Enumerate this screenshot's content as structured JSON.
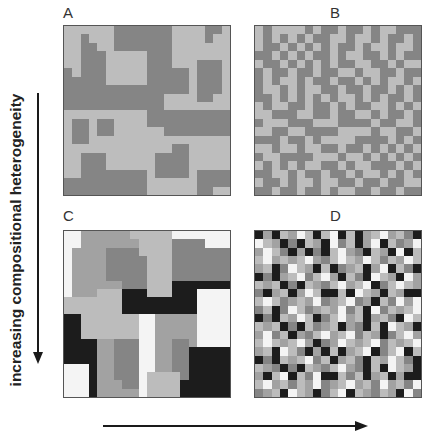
{
  "labels": {
    "A": "A",
    "B": "B",
    "C": "C",
    "D": "D",
    "y_axis": "increasing compositional heterogeneity",
    "x_axis": ""
  },
  "palette": {
    "W": "#f4f4f4",
    "L": "#bcbcbc",
    "M": "#a2a2a2",
    "D": "#858585",
    "K": "#1c1c1c",
    "A_light": "#bdbdbd",
    "A_dark": "#858585"
  },
  "panels": {
    "A": {
      "description": "two-class coarse-grained landscape",
      "rows": [
        "LLLLLLDDDDDDDLLLLDDL",
        "LLDLLLDDDDDDDLLLLDLL",
        "LLDDLLDDDDDDDLLLLLLL",
        "LLDDDLLLLLDDDLLLLLLL",
        "LLDDDLLLLLDDDLLLDDDL",
        "DLDDDLLLLLDDDDDLDDDL",
        "DDDDDLLLLLDDDDDLDDDL",
        "DDDDDDDDDDDDDDDLDDDL",
        "DDDDDDDDDDDDLLLLDDLL",
        "DDDDDDDDDDDDLLLLLLLL",
        "LLLLLLLLLLDDDDDDDDDD",
        "LDDLDDLLLLDDDDDDDDDD",
        "LDDLDDLLLLLLDDDDDDDD",
        "LDDLLLLLLLLLLLLLLLLL",
        "LLLLLLLLLLLLLDDLLLLL",
        "LLDDDLLLLLLDDDDLLLLL",
        "LLDDDLLLLLLDDDDLLLLL",
        "LLDDDDDDDDLDDDDLDDDD",
        "DDDDDDDDDDLLLLLLDDDD",
        "DDDDDDDDDDLLLLLLDDLL"
      ]
    },
    "B": {
      "description": "two-class fine-grained landscape",
      "rows": [
        "LDLLLLDLDDLDDLDLLDDD",
        "LDLDLDLDDLLDLLDLDDLD",
        "LDDLDLDLDLDDLDLLDLLD",
        "DDLDLDLDDLDLLDDLDLDD",
        "LDDLDLDLDLDDLLDDLDLL",
        "DLDDLDDLDDLLDLLDDLDD",
        "DLDLLDLDDLDDLDLDLLDL",
        "DLLDLDLLDDLDDLDDLDLD",
        "DDLDLDLDLDLLDLDLDDLD",
        "LDLLDDLDDLDLDDLLDLDL",
        "LLDDDLLDDLDDLLDLDDLD",
        "DLLLDDDLLLDDDDLDDLLD",
        "LLDDLLDDDDLLLLDLLDDL",
        "DDDLDDLDLLLLDDDDLDLD",
        "LLDLLDLLDDLDDLDLDLDL",
        "DLLDDDDLLLDLLDLDLDLD",
        "LDLDLDLLDDLDLLDDDLDL",
        "DDLLDLDDLDDLDLLDLDLD",
        "LDDLDLLDLLDDLDDLDDLL",
        "DDLDDLDDLDLLDDLDDLDD"
      ]
    },
    "C": {
      "description": "five-class coarse-grained landscape",
      "rows": [
        "WWMMMMMMLLLLLWWWWWWW",
        "WWMMMMMMMLLLLDDDDWWW",
        "WMMMMDDDDLLLLDDDDDDD",
        "WMMMMDDDDDLLLDDDDDDD",
        "WMMMMDDDDDLLLDDDDDDD",
        "WMMMMDDDDDLLLDDDDDDD",
        "WMMMMMMDDDLLLKKKKKKK",
        "WMMMLLLKKKLLLKKKWWWW",
        "LLLLLLLKKKKKKKKKWWWW",
        "LLLLLLLKKKKKKKKKWWWW",
        "KKLLLLLLLWWMMMMMWWWW",
        "KKLLLLLLLWWMMMMMWWWW",
        "KKLLLLLLLWWMMMMMWWWW",
        "KKKKMMDDDWWMMDDMWWWW",
        "KKKKMMDDDWWMMDDKKKKK",
        "KKKKMMDDDWWMMDDKKKKK",
        "WWWKMMDDDWWMMDDKKKKK",
        "WWWKMMDDDWLLLLDKKKKK",
        "WWWKMMMDDWLLLLKKKKKK",
        "WWWKMMMMMWLLLLKKKKKK"
      ]
    },
    "D": {
      "description": "five-class fine-grained landscape",
      "rows": [
        "KMKLMWLKLWKLKMLWMLDK",
        "WLMKDKLMKWDLKMWKLDMW",
        "MWLDKMKDKLWMDKLMKWKL",
        "LWMLMLWMDLWLMWLDLMWL",
        "MLKDWLMKLKDMLKMWKLDK",
        "KDKMLWDLWMKLDKWLMKWM",
        "LMLKDKLMDLWMLWKDLWLM",
        "DKMLKMWLKKLKWLMKLMKK",
        "LWLDMLMWDMLWDMKLDWMW",
        "DLKDWLDMLMWDLKWDLMLW",
        "KDKLMWLKDLWMLKMLDKWL",
        "LMLKDKLDMLKMDKLKWLMK",
        "MWDLKMDLWMLWDLMKDLWM",
        "LWLMLWMKDMWLMLWDLMLW",
        "MLKWLDKMKLKMLWKDLWKL",
        "KDKLMLWDLKMLDKLMWLDK",
        "LMDKDKLMDLWMDKLKWLMK",
        "MKLWKLDWKKLDLKMLKMKK",
        "LWMLDLMWDMLWMLDWMLDW",
        "DMLKWLMKDLWKLMDLMKWD"
      ]
    }
  }
}
